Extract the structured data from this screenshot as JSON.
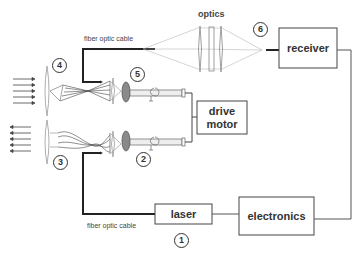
{
  "diagram": {
    "labels": {
      "fiber_top": "fiber optic cable",
      "fiber_bottom": "fiber optic cable",
      "optics": "optics"
    },
    "boxes": {
      "receiver": "receiver",
      "drive_motor_line1": "drive",
      "drive_motor_line2": "motor",
      "laser": "laser",
      "electronics": "electronics"
    },
    "markers": [
      "1",
      "2",
      "3",
      "4",
      "5",
      "6"
    ],
    "colors": {
      "line": "#444444",
      "fiber": "#222222",
      "lens_fill": "#8a8a8a",
      "ray": "#aaaaaa"
    }
  }
}
